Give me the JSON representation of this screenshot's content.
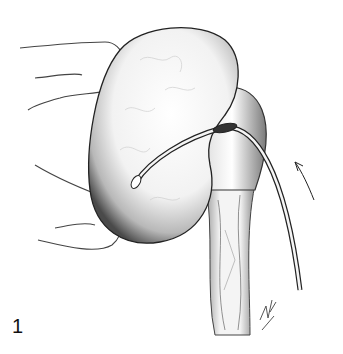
{
  "figure": {
    "number": "1",
    "annotations": [
      "arrow indicating catheter direction"
    ],
    "signature": "artist signature (illegible)"
  },
  "colors": {
    "background": "#ffffff",
    "ink": "#1a1a1a",
    "shading": "#555555"
  }
}
